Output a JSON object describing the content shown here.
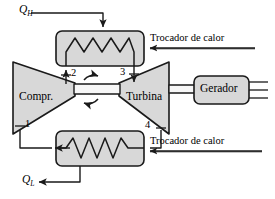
{
  "diagram": {
    "language": "pt-BR",
    "colors": {
      "stroke": "#1a1a1a",
      "component_fill": "#d8d8d8",
      "shaft_fill": "#f2f2f2",
      "background": "#ffffff"
    }
  },
  "components": {
    "compressor": {
      "label": "Compr.",
      "shape": "trapezoid-right-narrow"
    },
    "turbine": {
      "label": "Turbina",
      "shape": "trapezoid-left-narrow"
    },
    "generator": {
      "label": "Gerador",
      "shape": "rounded-rect",
      "output_lines": 3
    },
    "heat_exchanger_top": {
      "label": "Trocador de calor",
      "shape": "rounded-rect-with-zigzag",
      "zigzag_peaks": 3
    },
    "heat_exchanger_bottom": {
      "label": "Trocador de calor",
      "shape": "rounded-rect-with-zigzag",
      "zigzag_peaks": 3
    }
  },
  "heat_flows": {
    "high": {
      "symbol": "Q",
      "subscript": "H",
      "direction": "into-top-heat-exchanger"
    },
    "low": {
      "symbol": "Q",
      "subscript": "L",
      "direction": "out-of-bottom-heat-exchanger"
    }
  },
  "state_points": [
    {
      "id": "1",
      "label": "1",
      "location": "compressor-inlet"
    },
    {
      "id": "2",
      "label": "2",
      "location": "compressor-outlet"
    },
    {
      "id": "3",
      "label": "3",
      "location": "turbine-inlet"
    },
    {
      "id": "4",
      "label": "4",
      "location": "turbine-outlet"
    }
  ],
  "shaft": {
    "rotation_icon": "rotation-arrow-icon"
  }
}
